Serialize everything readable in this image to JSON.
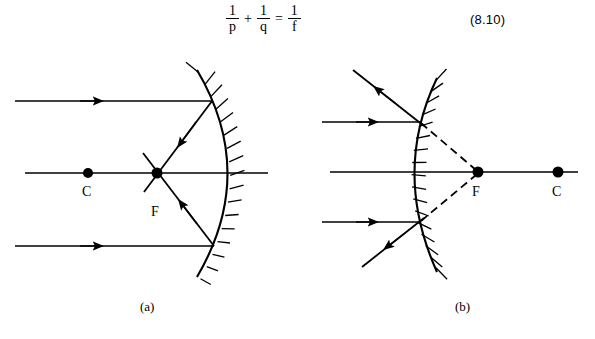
{
  "equation": {
    "name": "thin-lens-mirror-equation",
    "terms": [
      {
        "num": "1",
        "den": "p"
      },
      {
        "num": "1",
        "den": "q"
      },
      {
        "num": "1",
        "den": "f"
      }
    ],
    "operator_plus": "+",
    "operator_equals": "=",
    "number": "(8.10)"
  },
  "figure": {
    "panels": [
      {
        "key": "a",
        "caption": "(a)",
        "mirror_type": "concave",
        "description": "Parallel rays reflect off a concave mirror and converge through the focal point F; C marks the center of curvature.",
        "points": [
          {
            "name": "center-of-curvature",
            "label": "C",
            "x": 88,
            "y": 173,
            "label_x": 82,
            "label_y": 196
          },
          {
            "name": "focal-point",
            "label": "F",
            "x": 157,
            "y": 173,
            "label_x": 151,
            "label_y": 215
          }
        ],
        "axis": {
          "x1": 25,
          "y1": 173,
          "x2": 268,
          "y2": 173
        },
        "mirror_arc": "M 197,70 Q 258,173 197,277",
        "incident_rays": [
          {
            "x1": 15,
            "y1": 101,
            "x2": 212,
            "y2": 101,
            "arrow_x": 97,
            "arrow_y": 101
          },
          {
            "x1": 15,
            "y1": 246,
            "x2": 214,
            "y2": 246,
            "arrow_x": 97,
            "arrow_y": 246
          }
        ],
        "reflected_rays": [
          {
            "x1": 212,
            "y1": 101,
            "x2": 147,
            "y2": 188,
            "arrow_x": 182,
            "arrow_y": 141
          },
          {
            "x1": 214,
            "y1": 246,
            "x2": 146,
            "y2": 157,
            "arrow_x": 181,
            "arrow_y": 201
          }
        ]
      },
      {
        "key": "b",
        "caption": "(b)",
        "mirror_type": "convex",
        "description": "Parallel rays reflect off a convex mirror and diverge; dashed extensions trace back to the virtual focal point F, with C beyond it.",
        "points": [
          {
            "name": "focal-point",
            "label": "F",
            "x": 478,
            "y": 172,
            "label_x": 472,
            "label_y": 195
          },
          {
            "name": "center-of-curvature",
            "label": "C",
            "x": 558,
            "y": 172,
            "label_x": 552,
            "label_y": 195
          }
        ],
        "axis": {
          "x1": 330,
          "y1": 172,
          "x2": 578,
          "y2": 172
        },
        "mirror_arc": "M 437,78 Q 392,172 437,272",
        "incident_rays": [
          {
            "x1": 322,
            "y1": 122,
            "x2": 420,
            "y2": 122,
            "arrow_x": 371,
            "arrow_y": 122
          },
          {
            "x1": 322,
            "y1": 222,
            "x2": 420,
            "y2": 222,
            "arrow_x": 371,
            "arrow_y": 222
          }
        ],
        "reflected_rays": [
          {
            "x1": 420,
            "y1": 122,
            "x2": 353,
            "y2": 70,
            "arrow_x": 377,
            "arrow_y": 89
          },
          {
            "x1": 420,
            "y1": 222,
            "x2": 362,
            "y2": 267,
            "arrow_x": 386,
            "arrow_y": 248
          }
        ],
        "virtual_rays": [
          {
            "x1": 420,
            "y1": 122,
            "x2": 478,
            "y2": 172
          },
          {
            "x1": 420,
            "y1": 222,
            "x2": 478,
            "y2": 172
          }
        ]
      }
    ]
  },
  "colors": {
    "ink": "#000000",
    "background": "#ffffff"
  }
}
